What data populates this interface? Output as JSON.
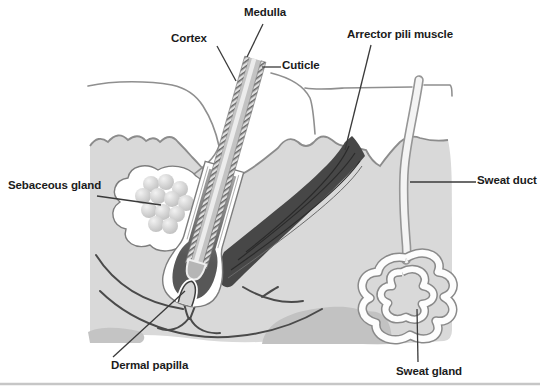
{
  "diagram": {
    "labels": {
      "medulla": "Medulla",
      "cortex": "Cortex",
      "cuticle": "Cuticle",
      "arrector_pili_muscle": "Arrector pili muscle",
      "sebaceous_gland": "Sebaceous gland",
      "sweat_duct": "Sweat duct",
      "dermal_papilla": "Dermal papilla",
      "sweat_gland": "Sweat gland"
    },
    "colors": {
      "background": "#ffffff",
      "dermis": "#d9d9d9",
      "subcutaneous_blob": "#c2c2c2",
      "muscle": "#474747",
      "inner_root_sheath": "#5a5a5a",
      "hair_cortex": "#c3c3c3",
      "medulla_highlight": "#ececec",
      "gland_cell": "#c6c6c6",
      "outline": "#8c8c8c",
      "pointer_line": "#3a3a3a",
      "label_text": "#1b1b1b"
    }
  }
}
